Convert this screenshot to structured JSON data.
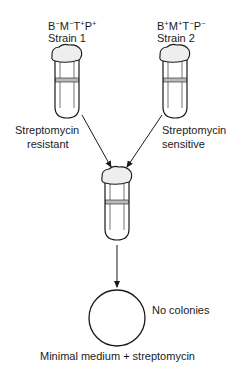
{
  "strain1": {
    "genotype": [
      "B",
      "−",
      "M",
      "−",
      "T",
      "+",
      "P",
      "+"
    ],
    "genotype_text": "B−M−T+P+",
    "label": "Strain 1",
    "phenotype_line1": "Streptomycin",
    "phenotype_line2": "resistant"
  },
  "strain2": {
    "genotype": [
      "B",
      "+",
      "M",
      "+",
      "T",
      "−",
      "P",
      "−"
    ],
    "genotype_text": "B+M+T−P−",
    "label": "Strain 2",
    "phenotype_line1": "Streptomycin",
    "phenotype_line2": "sensitive"
  },
  "plate": {
    "result": "No colonies",
    "medium": "Minimal medium + streptomycin"
  }
}
